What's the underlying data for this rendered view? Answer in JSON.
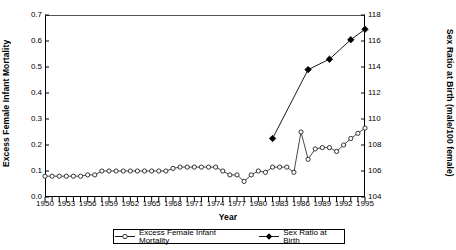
{
  "chart_data": {
    "type": "line",
    "title": "",
    "xlabel": "Year",
    "ylabel": "Excess Female Infant Mortality",
    "ylabel_secondary": "Sex Ratio at Birth (male/100 female)",
    "grid": false,
    "legend_position": "bottom",
    "xlim": [
      1950,
      1995
    ],
    "ylim": [
      0.0,
      0.7
    ],
    "ylim_secondary": [
      104,
      118
    ],
    "x_tick_labels": [
      "1950",
      "1953",
      "1956",
      "1959",
      "1962",
      "1965",
      "1968",
      "1971",
      "1974",
      "1977",
      "1980",
      "1983",
      "1986",
      "1989",
      "1992",
      "1995"
    ],
    "x_tick_step": 3,
    "x_minor_tick_step": 1,
    "y_tick_labels": [
      "0.0",
      "0.1",
      "0.2",
      "0.3",
      "0.4",
      "0.5",
      "0.6",
      "0.7"
    ],
    "y_tick_labels_secondary": [
      "104",
      "106",
      "108",
      "110",
      "112",
      "114",
      "116",
      "118"
    ],
    "series": [
      {
        "name": "Excess Female Infant Mortality",
        "axis": "left",
        "marker": "open-circle",
        "color": "#333333",
        "x": [
          1950,
          1951,
          1952,
          1953,
          1954,
          1955,
          1956,
          1957,
          1958,
          1959,
          1960,
          1961,
          1962,
          1963,
          1964,
          1965,
          1966,
          1967,
          1968,
          1969,
          1970,
          1971,
          1972,
          1973,
          1974,
          1975,
          1976,
          1977,
          1978,
          1979,
          1980,
          1981,
          1982,
          1983,
          1984,
          1985,
          1986,
          1987,
          1988,
          1989,
          1990,
          1991,
          1992,
          1993,
          1994,
          1995
        ],
        "values": [
          0.08,
          0.08,
          0.08,
          0.08,
          0.08,
          0.08,
          0.085,
          0.085,
          0.1,
          0.1,
          0.1,
          0.1,
          0.1,
          0.1,
          0.1,
          0.1,
          0.1,
          0.1,
          0.11,
          0.115,
          0.115,
          0.115,
          0.115,
          0.115,
          0.115,
          0.1,
          0.085,
          0.085,
          0.06,
          0.085,
          0.1,
          0.095,
          0.115,
          0.115,
          0.115,
          0.095,
          0.25,
          0.145,
          0.185,
          0.19,
          0.19,
          0.175,
          0.2,
          0.225,
          0.245,
          0.265
        ]
      },
      {
        "name": "Sex Ratio at Birth",
        "axis": "right",
        "marker": "filled-diamond",
        "color": "#000000",
        "x": [
          1982,
          1987,
          1990,
          1993,
          1995
        ],
        "values": [
          108.5,
          113.8,
          114.6,
          116.1,
          116.9
        ]
      }
    ]
  },
  "legend": {
    "items": [
      {
        "label": "Excess Female Infant Mortality",
        "marker": "open-circle"
      },
      {
        "label": "Sex Ratio at Birth",
        "marker": "filled-diamond"
      }
    ]
  }
}
